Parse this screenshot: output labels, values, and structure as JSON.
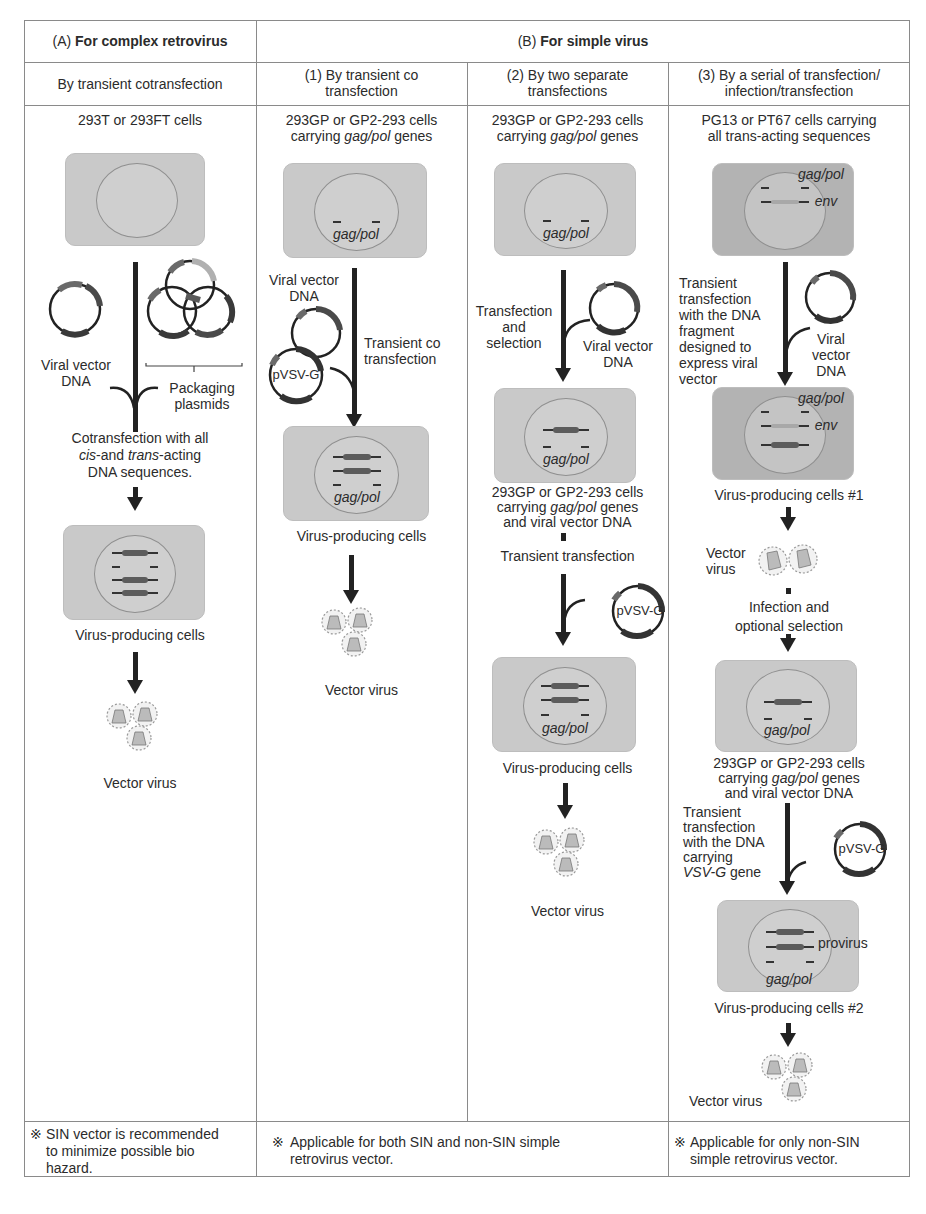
{
  "header": {
    "a_prefix": "(A) ",
    "a_title": "For complex retrovirus",
    "b_prefix": "(B) ",
    "b_title": "For simple virus"
  },
  "subheaders": {
    "a": "By transient cotransfection",
    "b1_line1": "(1) By transient co",
    "b1_line2": "transfection",
    "b2_line1": "(2) By two separate",
    "b2_line2": "transfections",
    "b3_line1": "(3) By a serial of transfection/",
    "b3_line2": "infection/transfection"
  },
  "col_a": {
    "cells_title": "293T or 293FT cells",
    "viral_vector_l1": "Viral vector",
    "viral_vector_l2": "DNA",
    "packaging_l1": "Packaging",
    "packaging_l2": "plasmids",
    "cotransfection_l1": "Cotransfection with all",
    "cotransfection_l2_cis": "cis",
    "cotransfection_l2_mid": "-and ",
    "cotransfection_l2_trans": "trans",
    "cotransfection_l2_end": "-acting",
    "cotransfection_l3": "DNA sequences.",
    "producing": "Virus-producing cells",
    "vector_virus": "Vector virus"
  },
  "col_b1": {
    "cells_l1": "293GP or GP2-293 cells",
    "cells_l2_pre": "carrying ",
    "cells_l2_gene": "gag/pol",
    "cells_l2_post": " genes",
    "gene_label": "gag/pol",
    "viral_vector_l1": "Viral vector",
    "viral_vector_l2": "DNA",
    "plasmid": "pVSV-G",
    "transient_l1": "Transient co",
    "transient_l2": "transfection",
    "gene_label2": "gag/pol",
    "producing": "Virus-producing cells",
    "vector_virus": "Vector virus"
  },
  "col_b2": {
    "cells_l1": "293GP or GP2-293 cells",
    "cells_l2_pre": "carrying ",
    "cells_l2_gene": "gag/pol",
    "cells_l2_post": " genes",
    "gene_label": "gag/pol",
    "transfection_l1": "Transfection",
    "transfection_l2": "and",
    "transfection_l3": "selection",
    "viral_vector_l1": "Viral vector",
    "viral_vector_l2": "DNA",
    "gene_label2": "gag/pol",
    "mid_l1": "293GP or GP2-293 cells",
    "mid_l2_pre": "carrying ",
    "mid_l2_gene": "gag/pol",
    "mid_l2_post": " genes",
    "mid_l3": "and viral vector DNA",
    "transient": "Transient transfection",
    "plasmid": "pVSV-G",
    "gene_label3": "gag/pol",
    "producing": "Virus-producing cells",
    "vector_virus": "Vector virus"
  },
  "col_b3": {
    "cells_l1": "PG13 or PT67 cells carrying",
    "cells_l2": "all trans-acting sequences",
    "gag_pol": "gag/pol",
    "env": "env",
    "transient_lines": [
      "Transient",
      "transfection",
      "with the DNA",
      "fragment",
      "designed to",
      "express viral",
      "vector"
    ],
    "viral_l1": "Viral",
    "viral_l2": "vector",
    "viral_l3": "DNA",
    "gag_pol2": "gag/pol",
    "env2": "env",
    "producing1": "Virus-producing cells #1",
    "vector_l1": "Vector",
    "vector_l2": "virus",
    "infection_l1": "Infection and",
    "infection_l2": "optional selection",
    "gag_pol3": "gag/pol",
    "mid_l1": "293GP or GP2-293 cells",
    "mid_l2_pre": "carrying ",
    "mid_l2_gene": "gag/pol",
    "mid_l2_post": " genes",
    "mid_l3": "and viral vector DNA",
    "vsvg_lines": [
      "Transient",
      "transfection",
      "with the DNA",
      "carrying"
    ],
    "vsvg_gene": "VSV-G",
    "vsvg_gene_post": " gene",
    "plasmid": "pVSV-G",
    "provirus": "provirus",
    "gag_pol4": "gag/pol",
    "producing2": "Virus-producing cells #2",
    "vector_virus": "Vector virus"
  },
  "footer": {
    "mark": "※",
    "a_l1": "SIN vector is recommended",
    "a_l2": "to minimize possible bio",
    "a_l3": "hazard.",
    "b12_l1": "Applicable for both SIN and non-SIN simple",
    "b12_l2": "retrovirus vector.",
    "b3_l1": "Applicable for only non-SIN",
    "b3_l2": "simple retrovirus vector."
  },
  "colors": {
    "cell": "#c9c9c9",
    "cell_dark": "#b3b3b3",
    "nucleus_outline": "#8f8f8f",
    "arrow": "#222222",
    "border": "#8a8a8a"
  }
}
